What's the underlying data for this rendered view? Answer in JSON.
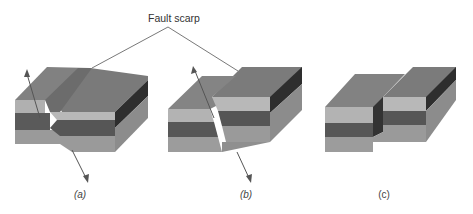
{
  "title_label": "Fault scarp",
  "panels": [
    {
      "id": "a",
      "caption": "(a)",
      "description": "Block with raised fault scarp; arrows show opposite displacement along fault"
    },
    {
      "id": "b",
      "caption": "(b)",
      "description": "Block offset along inclined fault plane with fault scarp; arrows show displacement"
    },
    {
      "id": "c",
      "caption": "(c)",
      "description": "Eroded block showing offset strata with no arrows"
    }
  ],
  "colors": {
    "top": "#7d7d7d",
    "top_dark": "#6e6e6e",
    "layer_light": "#b3b3b3",
    "layer_dark": "#5a5a5a",
    "layer_bottom": "#9c9c9c",
    "side_dark": "#3a3a3a",
    "side_mid": "#8a8a8a",
    "arrow": "#555555",
    "leader": "#555555"
  }
}
